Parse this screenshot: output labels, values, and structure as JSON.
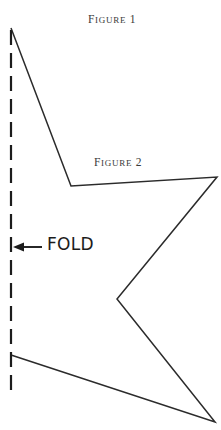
{
  "figure": {
    "background_color": "#ffffff",
    "stroke_color": "#2b2b2b",
    "caption_color": "#3a3a3a",
    "width": 221,
    "height": 430,
    "captions": [
      {
        "name": "figure-1-caption",
        "initial": "F",
        "smallcaps": "IGURE",
        "number": "1",
        "x": 88,
        "y": 10
      },
      {
        "name": "figure-2-caption",
        "initial": "F",
        "smallcaps": "IGURE",
        "number": "2",
        "x": 94,
        "y": 153
      }
    ],
    "fold_label": {
      "text": "FOLD",
      "x": 47,
      "y": 236
    },
    "fold_line": {
      "label": "fold line",
      "x": 11,
      "y_start": 30,
      "y_end": 398,
      "dash": "15 8",
      "stroke_width": 2.2
    },
    "fold_arrow": {
      "label": "arrow pointing to fold line",
      "tail_x": 42,
      "tip_x": 13,
      "y": 247
    },
    "outline": {
      "label": "cut-out star polygon outline",
      "stroke_width": 1.5,
      "points": "11,28 71,186 217,177 117,299 215,422 11,355"
    },
    "vertices": [
      {
        "name": "top-point",
        "x": 11,
        "y": 28
      },
      {
        "name": "upper-inner-notch",
        "x": 71,
        "y": 186
      },
      {
        "name": "right-upper-point",
        "x": 217,
        "y": 177
      },
      {
        "name": "middle-inner-notch",
        "x": 117,
        "y": 299
      },
      {
        "name": "right-lower-point",
        "x": 215,
        "y": 422
      },
      {
        "name": "bottom-fold-point",
        "x": 11,
        "y": 355
      }
    ]
  }
}
